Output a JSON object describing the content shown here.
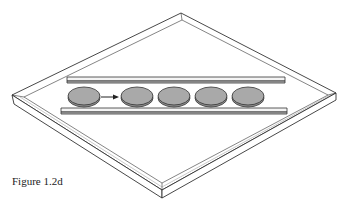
{
  "figure": {
    "caption": "Figure 1.2d",
    "colors": {
      "line": "#333333",
      "coin_fill": "#a9a9a9",
      "coin_edge": "#8c8c8c",
      "tray_fill": "#ffffff",
      "rail_fill": "#f2f2f2"
    },
    "coin_count": 5,
    "arrow": "right-arrow"
  }
}
